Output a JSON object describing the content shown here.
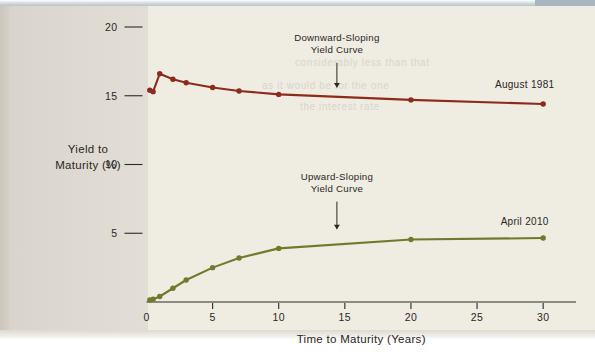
{
  "figure": {
    "background_color": "#e6e2da",
    "panel_color": "#efece2"
  },
  "chart_data": {
    "type": "line",
    "title": "",
    "subtitle": "",
    "xlabel": "Time to Maturity (Years)",
    "ylabel": "Yield to Maturity (%)",
    "ylabel_line1": "Yield to",
    "ylabel_line2": "Maturity (%)",
    "xlim": [
      0,
      31.5
    ],
    "ylim": [
      0,
      21
    ],
    "xticks": [
      0,
      5,
      10,
      15,
      20,
      25,
      30
    ],
    "xtick_labels": [
      "0",
      "5",
      "10",
      "15",
      "20",
      "25",
      "30"
    ],
    "yticks": [
      0,
      5,
      10,
      15,
      20
    ],
    "ytick_labels": [
      "0",
      "5",
      "10",
      "15",
      "20"
    ],
    "ytick_labels_shown": [
      "5",
      "10",
      "15",
      "20"
    ],
    "grid": false,
    "legend_position": "inline-right-of-series",
    "series": [
      {
        "name": "August 1981",
        "color": "#8e2a1c",
        "label": "August 1981",
        "label_x": 28.6,
        "label_y": 15.6,
        "x": [
          0.25,
          0.5,
          1,
          2,
          3,
          5,
          7,
          10,
          20,
          30
        ],
        "y": [
          15.4,
          15.3,
          16.6,
          16.2,
          15.95,
          15.6,
          15.35,
          15.1,
          14.7,
          14.4
        ]
      },
      {
        "name": "April 2010",
        "color": "#6e7a2c",
        "label": "April 2010",
        "label_x": 28.6,
        "label_y": 5.6,
        "x": [
          0.25,
          0.5,
          1,
          2,
          3,
          5,
          7,
          10,
          20,
          30
        ],
        "y": [
          0.15,
          0.2,
          0.4,
          1.0,
          1.6,
          2.5,
          3.2,
          3.9,
          4.55,
          4.65
        ]
      }
    ],
    "annotations": [
      {
        "id": "downward-sloping",
        "line1": "Downward-Sloping",
        "line2": "Yield Curve",
        "text_x": 14.4,
        "text_y": 19.0,
        "arrow_from_y": 17.4,
        "arrow_to_y": 15.6,
        "arrow_x": 14.4,
        "target_series": "August 1981"
      },
      {
        "id": "upward-sloping",
        "line1": "Upward-Sloping",
        "line2": "Yield Curve",
        "text_x": 14.4,
        "text_y": 8.9,
        "arrow_from_y": 7.3,
        "arrow_to_y": 5.3,
        "arrow_x": 14.4,
        "target_series": "April 2010"
      }
    ]
  },
  "ghost_text": {
    "line_a": "considerably less than that",
    "line_b": "as it would be for the one",
    "line_c": "the interest rate"
  }
}
